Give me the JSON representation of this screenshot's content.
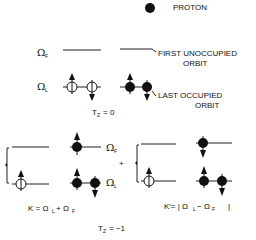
{
  "legend": {
    "proton_label": "PROTON"
  },
  "tz0": {
    "omega_f": "Ω",
    "omega_f_sub": "F",
    "omega_l": "Ω",
    "omega_l_sub": "L",
    "first_unoccupied_line1": "FIRST UNOCCUPIED",
    "first_unoccupied_line2": "ORBIT",
    "last_occupied_line1": "LAST  OCCUPIED",
    "last_occupied_line2": "ORBIT",
    "tz_label": "T",
    "tz_sub": "Z",
    "tz_value": "= 0"
  },
  "tzm1": {
    "omega_f": "Ω",
    "omega_f_sub": "F",
    "omega_l": "Ω",
    "omega_l_sub": "L",
    "plus": "+",
    "k_formula": "K = Ω",
    "k_formula_mid": "+ Ω",
    "kprime_formula": "K′= | Ω",
    "kprime_formula_mid": "− Ω",
    "kprime_end": "|",
    "sub_l": "L",
    "sub_f": "F",
    "tz_label": "T",
    "tz_sub": "Z",
    "tz_value": "= −1"
  }
}
